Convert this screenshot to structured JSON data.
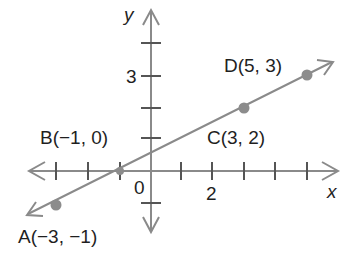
{
  "figure": {
    "axis_labels": {
      "x": "x",
      "y": "y"
    },
    "tick_labels": {
      "origin": "0",
      "x_two": "2",
      "y_three": "3"
    },
    "points": [
      {
        "name": "A",
        "label": "A(−3, −1)",
        "x": -3,
        "y": -1
      },
      {
        "name": "B",
        "label": "B(−1, 0)",
        "x": -1,
        "y": 0
      },
      {
        "name": "C",
        "label": "C(3, 2)",
        "x": 3,
        "y": 2
      },
      {
        "name": "D",
        "label": "D(5, 3)",
        "x": 5,
        "y": 3
      }
    ],
    "colors": {
      "axis": "#8a8a8a",
      "line": "#8a8a8a",
      "point": "#8c8c8c",
      "text": "#1f1f1f"
    }
  }
}
